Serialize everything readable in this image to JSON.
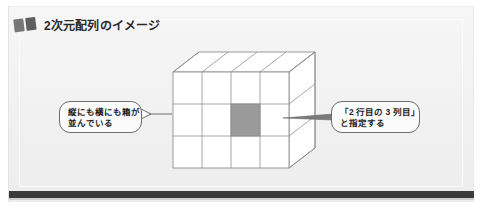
{
  "figure": {
    "title": "2次元配列のイメージ",
    "title_icon": "book-blocks-icon",
    "background_color": "#f1f1f1",
    "rule_color": "#3b3b3b"
  },
  "diagram": {
    "type": "3d-grid-box",
    "columns": 4,
    "rows": 3,
    "highlight": {
      "row": 2,
      "column": 3,
      "color": "#9a9a9a"
    },
    "line_color": "#8f8f8f",
    "face_color": "#ffffff"
  },
  "callouts": [
    {
      "id": "left",
      "name": "callout-rows-and-columns",
      "lines": [
        "縦にも横にも箱が",
        "並んでいる"
      ],
      "pointer": "right"
    },
    {
      "id": "right",
      "name": "callout-cell-address",
      "lines": [
        "「2 行目の 3 列目」",
        "と指定する"
      ],
      "pointer": "left"
    }
  ]
}
